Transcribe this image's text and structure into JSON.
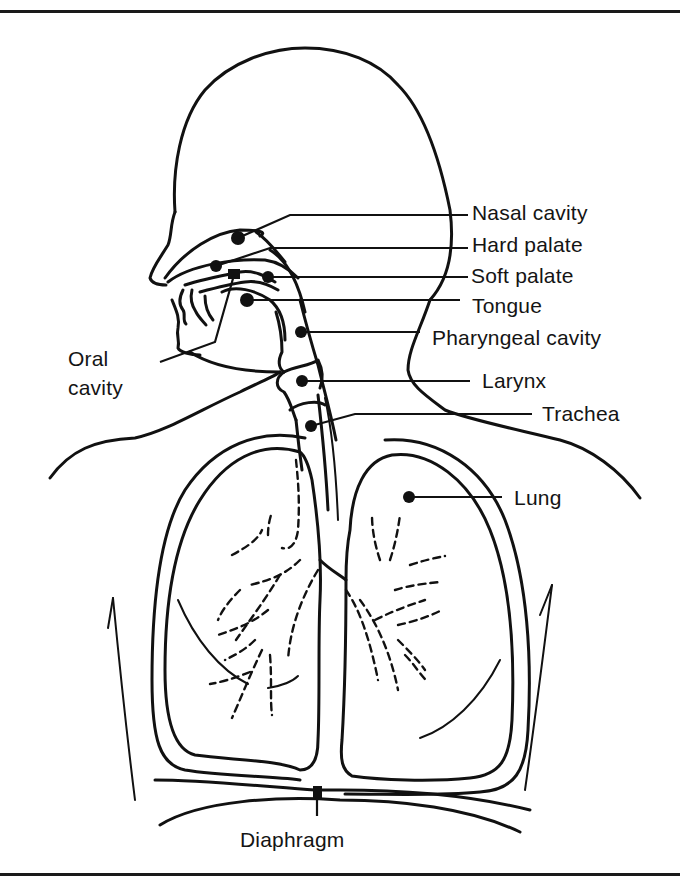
{
  "figure": {
    "colors": {
      "ink": "#111111",
      "background": "#ffffff"
    }
  },
  "labels": {
    "nasal_cavity": "Nasal cavity",
    "hard_palate": "Hard palate",
    "soft_palate": "Soft palate",
    "tongue": "Tongue",
    "pharyngeal_cavity": "Pharyngeal cavity",
    "larynx": "Larynx",
    "trachea": "Trachea",
    "lung": "Lung",
    "oral_cavity_line1": "Oral",
    "oral_cavity_line2": "cavity",
    "diaphragm": "Diaphragm"
  }
}
